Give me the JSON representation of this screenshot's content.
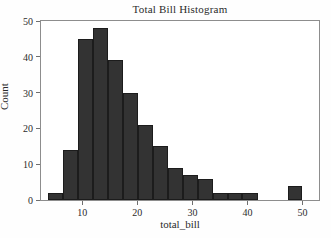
{
  "chart_data": {
    "type": "bar",
    "title": "Total Bill Histogram",
    "xlabel": "total_bill",
    "ylabel": "Count",
    "xlim": [
      2.5,
      53.0
    ],
    "ylim": [
      0,
      50
    ],
    "grid": false,
    "legend": null,
    "bar_color": "#333333",
    "bar_edge_color": "#1c1c1c",
    "bin_edges": [
      3.8,
      6.5,
      9.2,
      11.9,
      14.7,
      17.4,
      20.1,
      22.8,
      25.5,
      28.3,
      31.0,
      33.7,
      36.4,
      39.1,
      41.9,
      44.6,
      47.3,
      50.0
    ],
    "categories": [
      "3.8-6.5",
      "6.5-9.2",
      "9.2-11.9",
      "11.9-14.7",
      "14.7-17.4",
      "17.4-20.1",
      "20.1-22.8",
      "22.8-25.5",
      "25.5-28.3",
      "28.3-31.0",
      "31.0-33.7",
      "33.7-36.4",
      "36.4-39.1",
      "39.1-41.9",
      "41.9-44.6",
      "44.6-47.3",
      "47.3-50.0"
    ],
    "values": [
      2,
      14,
      45,
      48,
      39,
      30,
      21,
      15,
      9,
      7,
      6,
      2,
      2,
      2,
      0,
      0,
      4
    ],
    "xticks": [
      10,
      20,
      30,
      40,
      50
    ],
    "xtick_labels": [
      "10",
      "20",
      "30",
      "40",
      "50"
    ],
    "yticks": [
      0,
      10,
      20,
      30,
      40,
      50
    ],
    "ytick_labels": [
      "0",
      "10",
      "20",
      "30",
      "40",
      "50"
    ]
  }
}
